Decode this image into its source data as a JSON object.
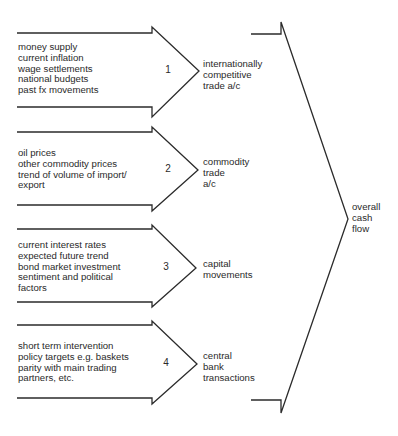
{
  "diagram": {
    "type": "flow-arrows",
    "stroke_color": "#2b2b2b",
    "arrows": [
      {
        "number": "1",
        "factors": [
          "money supply",
          "current inflation",
          "wage settlements",
          "national budgets",
          "past fx movements"
        ],
        "outcome": [
          "internationally",
          "competitive",
          "trade a/c"
        ]
      },
      {
        "number": "2",
        "factors": [
          "oil prices",
          "other commodity prices",
          "trend of volume of import/",
          "export"
        ],
        "outcome": [
          "commodity",
          "trade",
          "a/c"
        ]
      },
      {
        "number": "3",
        "factors": [
          "current interest rates",
          "expected future trend",
          "bond market investment",
          "sentiment and political",
          "factors"
        ],
        "outcome": [
          "capital",
          "movements"
        ]
      },
      {
        "number": "4",
        "factors": [
          "short term intervention",
          "policy targets e.g. baskets",
          "parity with main trading",
          "partners, etc."
        ],
        "outcome": [
          "central",
          "bank",
          "transactions"
        ]
      }
    ],
    "final_outcome": [
      "overall",
      "cash",
      "flow"
    ]
  }
}
